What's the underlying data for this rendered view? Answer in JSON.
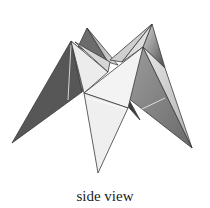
{
  "figure": {
    "caption": "side view",
    "vertices": {
      "top_left_peak": [
        87,
        28
      ],
      "top_right_peak": [
        152,
        24
      ],
      "left_peak": [
        71,
        41
      ],
      "center_right_peak": [
        143,
        47
      ],
      "left_tip": [
        12,
        143
      ],
      "bottom_tip": [
        98,
        173
      ],
      "right_tip": [
        192,
        148
      ]
    },
    "colors": {
      "dark_face": "#555555",
      "mid_face": "#8a8a8a",
      "light_face": "#e6e6e6",
      "lightest_face": "#f4f4f4",
      "edge": "#3a3a3a"
    }
  }
}
